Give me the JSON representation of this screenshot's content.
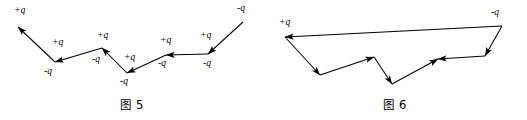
{
  "document": {
    "type": "physics-vector-diagram-pair",
    "width": 527,
    "height": 120,
    "background_color": "#ffffff",
    "stroke_color": "#000000"
  },
  "figures": [
    {
      "id": "figure-5",
      "caption": "图 5",
      "description": "Open zigzag chain of charge vectors ascending to the left",
      "labels": [
        {
          "key": "f5_l1",
          "text": "+q",
          "x": 14,
          "y": 13
        },
        {
          "key": "f5_l2",
          "text": "+q",
          "x": 52,
          "y": 45
        },
        {
          "key": "f5_l3",
          "text": "-q",
          "x": 44,
          "y": 74
        },
        {
          "key": "f5_l4",
          "text": "+q",
          "x": 97,
          "y": 38
        },
        {
          "key": "f5_l5",
          "text": "-q",
          "x": 92,
          "y": 62
        },
        {
          "key": "f5_l6",
          "text": "+q",
          "x": 124,
          "y": 60
        },
        {
          "key": "f5_l7",
          "text": "-q",
          "x": 120,
          "y": 84
        },
        {
          "key": "f5_l8",
          "text": "+q",
          "x": 160,
          "y": 43
        },
        {
          "key": "f5_l9",
          "text": "-q",
          "x": 158,
          "y": 66
        },
        {
          "key": "f5_l10",
          "text": "+q",
          "x": 200,
          "y": 38
        },
        {
          "key": "f5_l11",
          "text": "-q",
          "x": 203,
          "y": 66
        },
        {
          "key": "f5_l12",
          "text": "-q",
          "x": 237,
          "y": 11
        }
      ],
      "vertices": [
        {
          "x": 18,
          "y": 27
        },
        {
          "x": 55,
          "y": 62
        },
        {
          "x": 102,
          "y": 48
        },
        {
          "x": 127,
          "y": 73
        },
        {
          "x": 166,
          "y": 55
        },
        {
          "x": 208,
          "y": 54
        },
        {
          "x": 243,
          "y": 22
        }
      ]
    },
    {
      "id": "figure-6",
      "caption": "图 6",
      "description": "Closed polygon of charge vectors converging at left apex",
      "labels": [
        {
          "key": "f6_l1",
          "text": "+q",
          "x": 16,
          "y": 25
        },
        {
          "key": "f6_l2",
          "text": "-q",
          "x": 228,
          "y": 15
        }
      ],
      "vertices": [
        {
          "x": 22,
          "y": 37
        },
        {
          "x": 57,
          "y": 75
        },
        {
          "x": 111,
          "y": 57
        },
        {
          "x": 129,
          "y": 84
        },
        {
          "x": 175,
          "y": 59
        },
        {
          "x": 222,
          "y": 56
        },
        {
          "x": 239,
          "y": 26
        }
      ]
    }
  ]
}
